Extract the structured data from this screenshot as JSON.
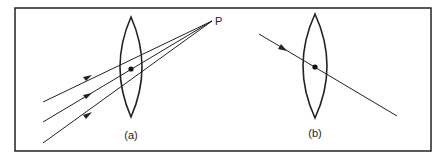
{
  "figure": {
    "background": "#ffffff",
    "stroke_color": "#222222",
    "frame": {
      "x": 15,
      "y": 8,
      "width": 416,
      "height": 143
    },
    "panels": [
      {
        "id": "a",
        "label": "(a)",
        "label_pos": {
          "x": 131,
          "y": 139
        },
        "lens": {
          "cx": 131,
          "top": 17,
          "bottom": 117,
          "half_width": 11
        },
        "center_dot": {
          "x": 131,
          "y": 69
        },
        "focal_point": {
          "label": "P",
          "x": 212,
          "y": 21,
          "label_pos": {
            "x": 215,
            "y": 24
          }
        },
        "rays": [
          {
            "from": [
              43,
              102
            ],
            "to": [
              212,
              21
            ],
            "arrow_at": [
              87,
              78
            ]
          },
          {
            "from": [
              43,
              122
            ],
            "to": [
              212,
              21
            ],
            "arrow_at": [
              87,
              96
            ]
          },
          {
            "from": [
              43,
              143
            ],
            "to": [
              212,
              21
            ],
            "arrow_at": [
              87,
              116
            ]
          }
        ]
      },
      {
        "id": "b",
        "label": "(b)",
        "label_pos": {
          "x": 315,
          "y": 137
        },
        "lens": {
          "cx": 315,
          "top": 14,
          "bottom": 118,
          "half_width": 12
        },
        "center_dot": {
          "x": 315,
          "y": 67
        },
        "rays": [
          {
            "from": [
              259,
              34
            ],
            "to": [
              397,
              116
            ],
            "arrow_at": [
              282,
              47
            ]
          }
        ]
      }
    ]
  }
}
